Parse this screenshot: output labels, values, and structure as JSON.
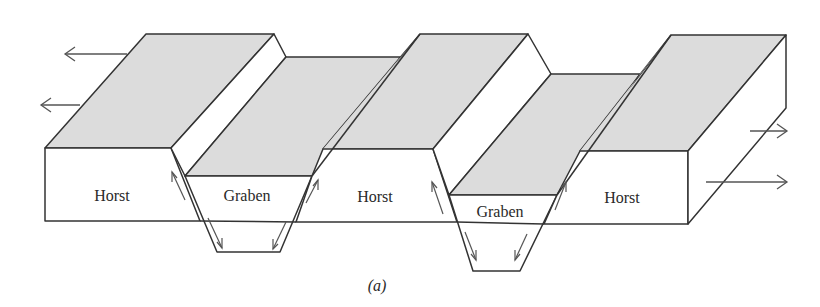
{
  "figure": {
    "caption": "(a)",
    "colors": {
      "surface_fill": "#dcdcdc",
      "side_fill": "#ffffff",
      "line": "#333333",
      "arrow": "#555555"
    },
    "blocks": [
      {
        "type": "horst",
        "label": "Horst"
      },
      {
        "type": "graben",
        "label": "Graben"
      },
      {
        "type": "horst",
        "label": "Horst"
      },
      {
        "type": "graben",
        "label": "Graben"
      },
      {
        "type": "horst",
        "label": "Horst"
      }
    ],
    "extension_arrows": {
      "left": [
        "arrow-left",
        "arrow-left"
      ],
      "right": [
        "arrow-right",
        "arrow-right"
      ]
    }
  }
}
